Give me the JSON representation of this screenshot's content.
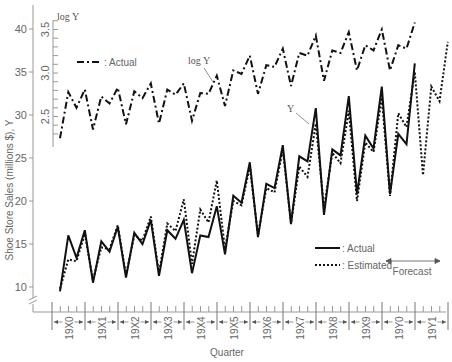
{
  "chart_data": {
    "type": "line",
    "title": "",
    "xlabel": "Quarter",
    "ylabel": "Shoe Store Sales (millions $), Y",
    "ylabel_secondary": "log Y",
    "ylim": [
      8,
      42
    ],
    "ylim_secondary": [
      2.3,
      3.65
    ],
    "yticks": [
      10,
      15,
      20,
      25,
      30,
      35,
      40
    ],
    "yticks_secondary": [
      "2.5",
      "3.0",
      "3.5"
    ],
    "year_labels": [
      "19X0",
      "19X1",
      "19X2",
      "19X3",
      "19X4",
      "19X5",
      "19X6",
      "19X7",
      "19X8",
      "19X9",
      "19Y0",
      "19Y1"
    ],
    "legend_log": [
      {
        "label": ": Actual",
        "style": "dash-dot"
      }
    ],
    "legend_main": [
      {
        "label": ": Actual",
        "style": "solid"
      },
      {
        "label": ": Estimated",
        "style": "dotted"
      }
    ],
    "annotations": [
      "log Y",
      "Y",
      "Forecast"
    ],
    "series": [
      {
        "name": "Actual Y",
        "style": "solid",
        "values": [
          9.5,
          16.0,
          13.4,
          16.6,
          10.5,
          15.3,
          14.1,
          17.0,
          11.1,
          16.3,
          15.0,
          17.8,
          11.3,
          16.6,
          15.6,
          17.8,
          11.6,
          16.0,
          15.8,
          19.4,
          13.8,
          20.6,
          19.8,
          24.5,
          15.8,
          22.0,
          21.5,
          26.5,
          17.3,
          25.2,
          24.6,
          30.8,
          18.4,
          26.0,
          25.3,
          32.2,
          20.8,
          27.6,
          26.1,
          33.3,
          20.8,
          27.8,
          26.6,
          36.0
        ]
      },
      {
        "name": "Estimated Y",
        "style": "dotted",
        "values": [
          9.8,
          13.2,
          13.0,
          16.2,
          10.8,
          14.6,
          14.4,
          17.2,
          11.4,
          16.0,
          15.4,
          18.2,
          11.6,
          17.4,
          16.5,
          20.2,
          12.7,
          19.0,
          17.5,
          22.4,
          14.4,
          20.0,
          19.5,
          24.0,
          16.0,
          21.5,
          21.0,
          26.0,
          17.4,
          24.0,
          22.8,
          29.0,
          19.2,
          25.6,
          24.4,
          30.5,
          20.0,
          26.8,
          25.7,
          32.0,
          20.6,
          30.2,
          28.6,
          35.0,
          23.0,
          33.3,
          31.6,
          38.5
        ]
      },
      {
        "name": "log Y Actual",
        "style": "dash-dot",
        "values": [
          2.25,
          2.78,
          2.6,
          2.81,
          2.35,
          2.73,
          2.65,
          2.83,
          2.41,
          2.79,
          2.71,
          2.88,
          2.42,
          2.81,
          2.75,
          2.88,
          2.45,
          2.77,
          2.76,
          2.97,
          2.62,
          3.03,
          2.99,
          3.2,
          2.76,
          3.09,
          3.07,
          3.28,
          2.85,
          3.23,
          3.2,
          3.43,
          2.91,
          3.26,
          3.23,
          3.47,
          3.03,
          3.32,
          3.26,
          3.5,
          3.03,
          3.32,
          3.28,
          3.58
        ]
      }
    ]
  }
}
